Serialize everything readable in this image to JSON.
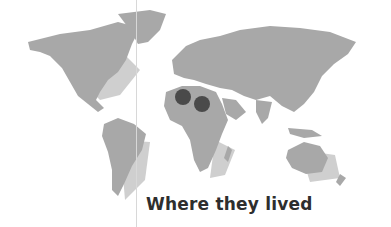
{
  "map": {
    "title": "Where they lived",
    "land_color": "#a8a8a8",
    "shadow_color": "#cfcfcf",
    "marker_color": "#4a4a4a",
    "markers": [
      {
        "label": "north-africa-west",
        "cx": 183,
        "cy": 97,
        "r": 8
      },
      {
        "label": "north-africa-east",
        "cx": 202,
        "cy": 104,
        "r": 8
      }
    ]
  }
}
